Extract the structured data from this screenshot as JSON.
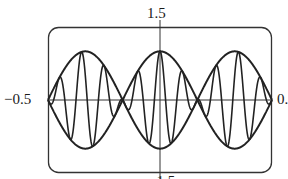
{
  "chart_data": {
    "type": "line",
    "title": "",
    "xlabel": "",
    "ylabel": "",
    "xlim": [
      -0.5,
      0.5
    ],
    "ylim": [
      -1.5,
      1.5
    ],
    "grid": false,
    "legend": null,
    "tick_labels": {
      "top": "1.5",
      "left": "−0.5",
      "right": "0.",
      "bottom": "−1.5"
    },
    "series": [
      {
        "name": "y = cos(20πx)·cos(3πx)",
        "role": "signal",
        "carrier_freq": 10,
        "envelope_freq": 1.5
      },
      {
        "name": "y = cos(3πx)",
        "role": "upper-envelope",
        "envelope_freq": 1.5
      },
      {
        "name": "y = −cos(3πx)",
        "role": "lower-envelope",
        "envelope_freq": 1.5
      }
    ],
    "envelope_nodes_x": [
      -0.5,
      -0.1667,
      0.1667,
      0.5
    ],
    "envelope_peaks": [
      {
        "x": -0.3333,
        "y": 1.0
      },
      {
        "x": 0.0,
        "y": 1.0
      },
      {
        "x": 0.3333,
        "y": 1.0
      }
    ]
  },
  "colors": {
    "stroke": "#222222",
    "background": "#ffffff",
    "frame": "#333333"
  }
}
